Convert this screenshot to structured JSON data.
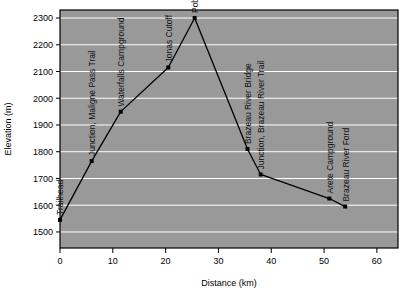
{
  "chart_data": {
    "type": "line",
    "title": "",
    "xlabel": "Distance (km)",
    "ylabel": "Elevation (m)",
    "xlim": [
      0,
      64
    ],
    "ylim": [
      1440,
      2330
    ],
    "grid": true,
    "legend": "none",
    "plot_background": "#999999",
    "gridline_color": "#ffffff",
    "line_color": "#000000",
    "marker_color": "#000000",
    "xticks": [
      0,
      10,
      20,
      30,
      40,
      50,
      60
    ],
    "xtick_labels": [
      "0",
      "10",
      "20",
      "30",
      "40",
      "50",
      "60"
    ],
    "yticks": [
      1500,
      1600,
      1700,
      1800,
      1900,
      2000,
      2100,
      2200,
      2300
    ],
    "ytick_labels": [
      "1500",
      "1600",
      "1700",
      "1800",
      "1900",
      "2000",
      "2100",
      "2200",
      "2300"
    ],
    "x": [
      0,
      6,
      11.5,
      20.5,
      25.5,
      35.5,
      38,
      51,
      54
    ],
    "values": [
      1545,
      1765,
      1950,
      2115,
      2300,
      1810,
      1715,
      1625,
      1595
    ],
    "point_labels": [
      "Trailhead",
      "Junction, Maligne Pass Trail",
      "Waterfalls Campground",
      "Jonas Cutoff",
      "Poboktan Pass",
      "Brazeau River Bridge",
      "Junction, Brazeau River Trail",
      "Arete Campground",
      "Brazeau River Ford"
    ]
  }
}
